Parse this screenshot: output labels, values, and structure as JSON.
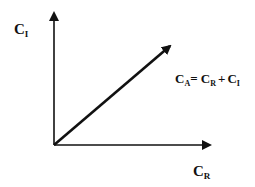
{
  "diagram": {
    "type": "vector-addition",
    "axes": {
      "y_axis": {
        "symbol": "C",
        "subscript": "I"
      },
      "x_axis": {
        "symbol": "C",
        "subscript": "R"
      }
    },
    "resultant": {
      "lhs": {
        "symbol": "C",
        "subscript": "A"
      },
      "equals": "=",
      "term1": {
        "symbol": "C",
        "subscript": "R"
      },
      "plus": "+",
      "term2": {
        "symbol": "C",
        "subscript": "I"
      }
    },
    "colors": {
      "stroke": "#111111",
      "background": "#ffffff"
    }
  }
}
